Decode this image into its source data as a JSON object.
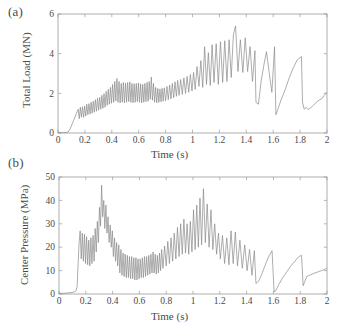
{
  "figure": {
    "panels": [
      {
        "tag": "(a)",
        "name": "total-load-panel"
      },
      {
        "tag": "(b)",
        "name": "center-pressure-panel"
      }
    ]
  },
  "chart_data": [
    {
      "type": "line",
      "panel": "(a)",
      "title": "",
      "xlabel": "Time (s)",
      "ylabel": "Total Load (MN)",
      "xlim": [
        0,
        2
      ],
      "ylim": [
        0,
        6
      ],
      "xticks": [
        0,
        0.2,
        0.4,
        0.6,
        0.8,
        1,
        1.2,
        1.4,
        1.6,
        1.8,
        2
      ],
      "xticklabels": [
        "0",
        "0.2",
        "0.4",
        "0.6",
        "0.8",
        "1",
        "1.2",
        "1.4",
        "1.6",
        "1.8",
        "2"
      ],
      "yticks": [
        0,
        2,
        4,
        6
      ],
      "yticklabels": [
        "0",
        "2",
        "4",
        "6"
      ],
      "grid": false,
      "legend": null,
      "line_color": "#8a8a8a",
      "series": [
        {
          "name": "Total Load",
          "x": [
            0.0,
            0.02,
            0.04,
            0.06,
            0.075,
            0.09,
            0.105,
            0.12,
            0.135,
            0.15,
            0.158,
            0.166,
            0.174,
            0.182,
            0.19,
            0.198,
            0.206,
            0.214,
            0.222,
            0.23,
            0.238,
            0.246,
            0.254,
            0.262,
            0.27,
            0.278,
            0.286,
            0.294,
            0.302,
            0.31,
            0.318,
            0.326,
            0.334,
            0.342,
            0.35,
            0.358,
            0.366,
            0.374,
            0.382,
            0.39,
            0.398,
            0.406,
            0.414,
            0.422,
            0.43,
            0.438,
            0.446,
            0.454,
            0.462,
            0.47,
            0.478,
            0.486,
            0.494,
            0.502,
            0.51,
            0.518,
            0.526,
            0.534,
            0.542,
            0.55,
            0.558,
            0.566,
            0.574,
            0.582,
            0.59,
            0.598,
            0.606,
            0.614,
            0.622,
            0.63,
            0.638,
            0.646,
            0.654,
            0.662,
            0.67,
            0.678,
            0.686,
            0.694,
            0.702,
            0.71,
            0.718,
            0.726,
            0.734,
            0.742,
            0.75,
            0.758,
            0.766,
            0.774,
            0.782,
            0.79,
            0.8,
            0.81,
            0.82,
            0.83,
            0.84,
            0.85,
            0.86,
            0.87,
            0.88,
            0.89,
            0.9,
            0.912,
            0.924,
            0.936,
            0.948,
            0.96,
            0.972,
            0.984,
            0.996,
            1.008,
            1.02,
            1.034,
            1.048,
            1.062,
            1.076,
            1.09,
            1.104,
            1.118,
            1.132,
            1.146,
            1.16,
            1.176,
            1.192,
            1.208,
            1.224,
            1.24,
            1.256,
            1.272,
            1.288,
            1.304,
            1.32,
            1.338,
            1.356,
            1.374,
            1.392,
            1.41,
            1.428,
            1.446,
            1.464,
            1.472,
            1.49,
            1.51,
            1.53,
            1.55,
            1.57,
            1.59,
            1.61,
            1.62,
            1.64,
            1.66,
            1.69,
            1.72,
            1.75,
            1.78,
            1.81,
            1.818,
            1.83,
            1.845,
            1.86,
            1.88,
            1.9,
            1.92,
            1.94,
            1.96,
            1.98,
            2.0
          ],
          "y": [
            0.02,
            0.02,
            0.02,
            0.03,
            0.05,
            0.2,
            0.45,
            0.7,
            0.95,
            1.2,
            0.72,
            1.3,
            0.8,
            1.32,
            0.78,
            1.36,
            0.85,
            1.45,
            0.92,
            1.48,
            0.95,
            1.55,
            1.0,
            1.6,
            1.05,
            1.68,
            1.1,
            1.75,
            1.15,
            1.8,
            1.2,
            1.9,
            1.25,
            1.98,
            1.3,
            2.1,
            1.4,
            2.2,
            1.45,
            2.3,
            1.5,
            2.45,
            1.55,
            2.6,
            1.62,
            2.75,
            1.55,
            2.6,
            1.52,
            2.5,
            1.55,
            2.55,
            1.52,
            2.52,
            1.55,
            2.55,
            1.58,
            2.58,
            1.55,
            2.5,
            1.52,
            2.48,
            1.55,
            2.5,
            1.58,
            2.52,
            1.55,
            2.48,
            1.52,
            2.45,
            1.55,
            2.5,
            1.58,
            2.55,
            1.6,
            2.6,
            1.7,
            2.82,
            1.65,
            2.5,
            1.55,
            2.3,
            1.52,
            2.25,
            1.55,
            2.22,
            1.58,
            2.25,
            1.6,
            2.28,
            1.62,
            2.35,
            1.68,
            2.42,
            1.72,
            2.5,
            1.78,
            2.58,
            1.85,
            2.65,
            1.9,
            2.7,
            1.95,
            2.78,
            2.0,
            2.85,
            2.05,
            2.95,
            2.12,
            3.05,
            2.2,
            3.35,
            2.35,
            3.65,
            2.3,
            4.35,
            2.45,
            4.05,
            2.4,
            4.45,
            2.55,
            4.5,
            2.45,
            4.6,
            2.55,
            4.65,
            2.6,
            4.7,
            2.8,
            4.95,
            5.4,
            3.1,
            4.7,
            3.05,
            4.8,
            3.1,
            4.35,
            2.6,
            4.15,
            1.55,
            1.45,
            2.6,
            3.4,
            4.1,
            3.05,
            2.05,
            4.35,
            0.92,
            1.3,
            1.7,
            2.2,
            2.8,
            3.3,
            3.7,
            3.85,
            1.55,
            1.2,
            1.3,
            1.18,
            1.28,
            1.4,
            1.55,
            1.65,
            1.72,
            1.9,
            2.05
          ]
        }
      ]
    },
    {
      "type": "line",
      "panel": "(b)",
      "title": "",
      "xlabel": "Time (s)",
      "ylabel": "Center Pressure (MPa)",
      "xlim": [
        0,
        2
      ],
      "ylim": [
        0,
        50
      ],
      "xticks": [
        0,
        0.2,
        0.4,
        0.6,
        0.8,
        1,
        1.2,
        1.4,
        1.6,
        1.8,
        2
      ],
      "xticklabels": [
        "0",
        "0.2",
        "0.4",
        "0.6",
        "0.8",
        "1",
        "1.2",
        "1.4",
        "1.6",
        "1.8",
        "2"
      ],
      "yticks": [
        0,
        10,
        20,
        30,
        40,
        50
      ],
      "yticklabels": [
        "0",
        "10",
        "20",
        "30",
        "40",
        "50"
      ],
      "grid": false,
      "legend": null,
      "line_color": "#8a8a8a",
      "series": [
        {
          "name": "Center Pressure",
          "x": [
            0.0,
            0.03,
            0.06,
            0.09,
            0.11,
            0.125,
            0.135,
            0.142,
            0.15,
            0.158,
            0.166,
            0.174,
            0.182,
            0.19,
            0.198,
            0.206,
            0.214,
            0.222,
            0.23,
            0.238,
            0.246,
            0.254,
            0.262,
            0.27,
            0.278,
            0.286,
            0.294,
            0.302,
            0.31,
            0.318,
            0.326,
            0.334,
            0.342,
            0.35,
            0.358,
            0.366,
            0.374,
            0.382,
            0.39,
            0.398,
            0.406,
            0.414,
            0.422,
            0.43,
            0.438,
            0.446,
            0.454,
            0.462,
            0.47,
            0.478,
            0.486,
            0.494,
            0.502,
            0.51,
            0.518,
            0.526,
            0.534,
            0.542,
            0.55,
            0.558,
            0.566,
            0.574,
            0.582,
            0.59,
            0.598,
            0.606,
            0.614,
            0.622,
            0.63,
            0.638,
            0.646,
            0.654,
            0.662,
            0.67,
            0.678,
            0.686,
            0.694,
            0.702,
            0.71,
            0.718,
            0.726,
            0.734,
            0.742,
            0.75,
            0.758,
            0.766,
            0.776,
            0.788,
            0.8,
            0.812,
            0.824,
            0.836,
            0.848,
            0.86,
            0.872,
            0.884,
            0.896,
            0.908,
            0.92,
            0.932,
            0.944,
            0.956,
            0.968,
            0.98,
            0.992,
            1.004,
            1.016,
            1.028,
            1.04,
            1.052,
            1.064,
            1.078,
            1.092,
            1.106,
            1.12,
            1.134,
            1.148,
            1.162,
            1.176,
            1.19,
            1.204,
            1.22,
            1.236,
            1.252,
            1.268,
            1.284,
            1.3,
            1.316,
            1.332,
            1.35,
            1.368,
            1.386,
            1.404,
            1.422,
            1.44,
            1.458,
            1.47,
            1.49,
            1.51,
            1.53,
            1.55,
            1.57,
            1.59,
            1.605,
            1.615,
            1.64,
            1.67,
            1.7,
            1.73,
            1.76,
            1.79,
            1.81,
            1.822,
            1.835,
            1.85,
            1.87,
            1.89,
            1.91,
            1.935,
            1.96,
            1.98,
            2.0
          ],
          "y": [
            0.3,
            0.3,
            0.4,
            0.6,
            0.8,
            1.2,
            3.0,
            12.0,
            22.0,
            27.0,
            15.0,
            26.0,
            14.0,
            25.5,
            13.0,
            24.5,
            12.5,
            23.0,
            12.0,
            24.0,
            13.0,
            25.0,
            14.0,
            28.0,
            18.0,
            31.0,
            22.0,
            37.0,
            29.0,
            46.5,
            33.0,
            40.0,
            28.0,
            38.0,
            26.0,
            33.0,
            22.0,
            29.5,
            20.0,
            27.0,
            16.0,
            24.0,
            14.0,
            22.0,
            12.0,
            21.0,
            9.0,
            19.0,
            8.0,
            17.5,
            7.5,
            17.0,
            7.0,
            16.5,
            7.0,
            16.0,
            6.5,
            16.0,
            6.5,
            15.5,
            6.0,
            15.5,
            6.0,
            15.0,
            6.5,
            15.0,
            7.0,
            15.5,
            7.0,
            16.0,
            7.5,
            16.0,
            8.0,
            16.5,
            8.5,
            17.0,
            9.0,
            18.0,
            9.0,
            17.0,
            8.5,
            16.5,
            9.0,
            17.5,
            10.0,
            19.0,
            11.0,
            20.5,
            12.0,
            22.5,
            13.0,
            24.0,
            14.0,
            26.0,
            15.0,
            28.5,
            16.0,
            30.0,
            17.0,
            32.0,
            17.5,
            30.0,
            17.0,
            31.0,
            18.0,
            36.0,
            19.0,
            38.0,
            20.0,
            41.0,
            21.0,
            45.0,
            22.0,
            38.5,
            20.0,
            36.0,
            19.0,
            30.0,
            17.0,
            26.0,
            15.0,
            25.0,
            13.0,
            24.0,
            12.5,
            27.0,
            13.0,
            26.5,
            12.0,
            23.0,
            11.0,
            21.0,
            10.0,
            19.0,
            8.0,
            18.5,
            4.5,
            5.5,
            8.0,
            11.0,
            14.0,
            16.5,
            18.5,
            1.0,
            1.2,
            4.0,
            7.0,
            9.5,
            12.0,
            14.0,
            16.0,
            16.5,
            3.5,
            5.5,
            7.5,
            8.0,
            8.5,
            9.0,
            9.5,
            10.0,
            10.5,
            11.0
          ]
        }
      ]
    }
  ]
}
